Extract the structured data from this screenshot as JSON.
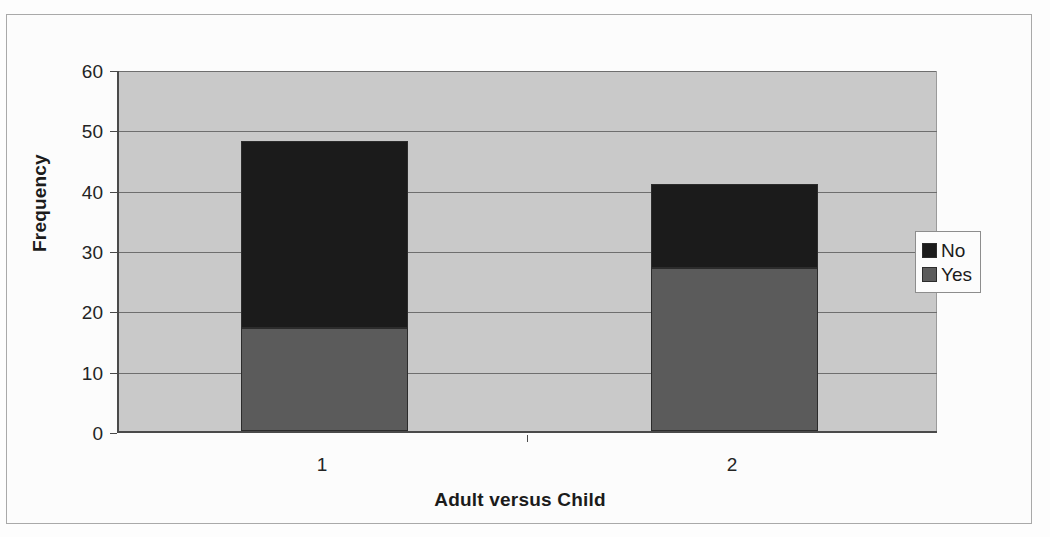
{
  "chart_data": {
    "type": "bar",
    "subtype": "stacked-column",
    "title": "",
    "xlabel": "Adult versus Child",
    "ylabel": "Frequency",
    "categories": [
      "1",
      "2"
    ],
    "series": [
      {
        "name": "No",
        "values": [
          31,
          14
        ],
        "color": "#1b1b1b"
      },
      {
        "name": "Yes",
        "values": [
          17,
          27
        ],
        "color": "#5b5b5b"
      }
    ],
    "stack_totals": [
      48,
      41
    ],
    "stack_order_bottom_to_top": [
      "Yes",
      "No"
    ],
    "ylim": [
      0,
      60
    ],
    "yticks": [
      0,
      10,
      20,
      30,
      40,
      50,
      60
    ],
    "ytick_labels": [
      "0",
      "10",
      "20",
      "30",
      "40",
      "50",
      "60"
    ],
    "grid": true,
    "grid_axis": "y",
    "legend_position": "right",
    "legend_entries": [
      "No",
      "Yes"
    ],
    "plot_background": "#c9c9c9",
    "figure_background": "#fcfcfc",
    "border_color": "#a9a9a9"
  },
  "axes": {
    "y_title": "Frequency",
    "x_title": "Adult versus Child"
  }
}
